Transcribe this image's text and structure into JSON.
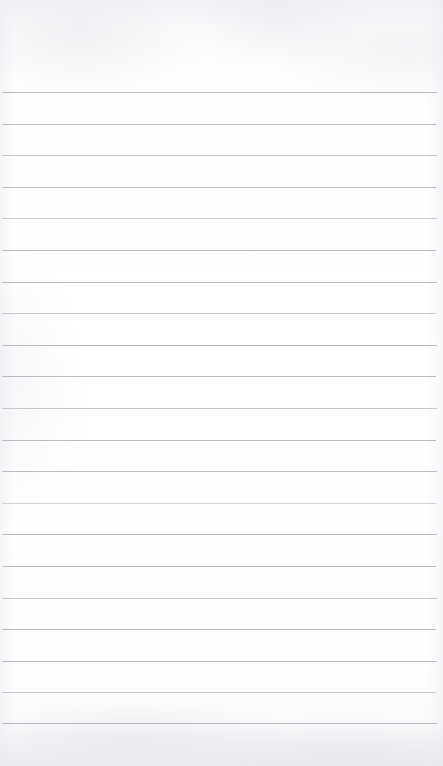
{
  "document": {
    "kind": "lined-notepad-page",
    "title": "",
    "body_text": "",
    "is_blank": true
  },
  "canvas": {
    "width_px": 443,
    "height_px": 766,
    "background_color": "#fcfcfd",
    "paper_tint_color": "#f6f7f8"
  },
  "ruling": {
    "line_color": "#b9bcc2",
    "line_thickness_px": 1,
    "line_spacing_px": 31.6,
    "first_line_y_px": 92,
    "last_line_y_px": 723,
    "line_count": 21,
    "left_margin_px": 2,
    "right_margin_px": 6,
    "line_width_px": 435,
    "vertical_margin_rule": false,
    "lines": [
      {
        "index": 1,
        "y": 92,
        "x": 2,
        "width": 435,
        "tone": "normal"
      },
      {
        "index": 2,
        "y": 124,
        "x": 2,
        "width": 434,
        "tone": "normal"
      },
      {
        "index": 3,
        "y": 155,
        "x": 2,
        "width": 435,
        "tone": "light"
      },
      {
        "index": 4,
        "y": 187,
        "x": 2,
        "width": 434,
        "tone": "normal"
      },
      {
        "index": 5,
        "y": 218,
        "x": 2,
        "width": 435,
        "tone": "light"
      },
      {
        "index": 6,
        "y": 250,
        "x": 2,
        "width": 434,
        "tone": "normal"
      },
      {
        "index": 7,
        "y": 282,
        "x": 2,
        "width": 435,
        "tone": "normal"
      },
      {
        "index": 8,
        "y": 313,
        "x": 2,
        "width": 434,
        "tone": "light"
      },
      {
        "index": 9,
        "y": 345,
        "x": 2,
        "width": 435,
        "tone": "normal"
      },
      {
        "index": 10,
        "y": 376,
        "x": 2,
        "width": 434,
        "tone": "normal"
      },
      {
        "index": 11,
        "y": 408,
        "x": 2,
        "width": 435,
        "tone": "light"
      },
      {
        "index": 12,
        "y": 440,
        "x": 2,
        "width": 434,
        "tone": "normal"
      },
      {
        "index": 13,
        "y": 471,
        "x": 2,
        "width": 435,
        "tone": "normal"
      },
      {
        "index": 14,
        "y": 503,
        "x": 2,
        "width": 434,
        "tone": "lighter"
      },
      {
        "index": 15,
        "y": 534,
        "x": 2,
        "width": 435,
        "tone": "normal"
      },
      {
        "index": 16,
        "y": 566,
        "x": 2,
        "width": 434,
        "tone": "normal"
      },
      {
        "index": 17,
        "y": 598,
        "x": 2,
        "width": 435,
        "tone": "light"
      },
      {
        "index": 18,
        "y": 629,
        "x": 2,
        "width": 434,
        "tone": "normal"
      },
      {
        "index": 19,
        "y": 661,
        "x": 2,
        "width": 435,
        "tone": "normal"
      },
      {
        "index": 20,
        "y": 692,
        "x": 2,
        "width": 434,
        "tone": "light"
      },
      {
        "index": 21,
        "y": 723,
        "x": 2,
        "width": 435,
        "tone": "normal"
      }
    ]
  },
  "zones": {
    "header_label": "",
    "footer_label": ""
  }
}
